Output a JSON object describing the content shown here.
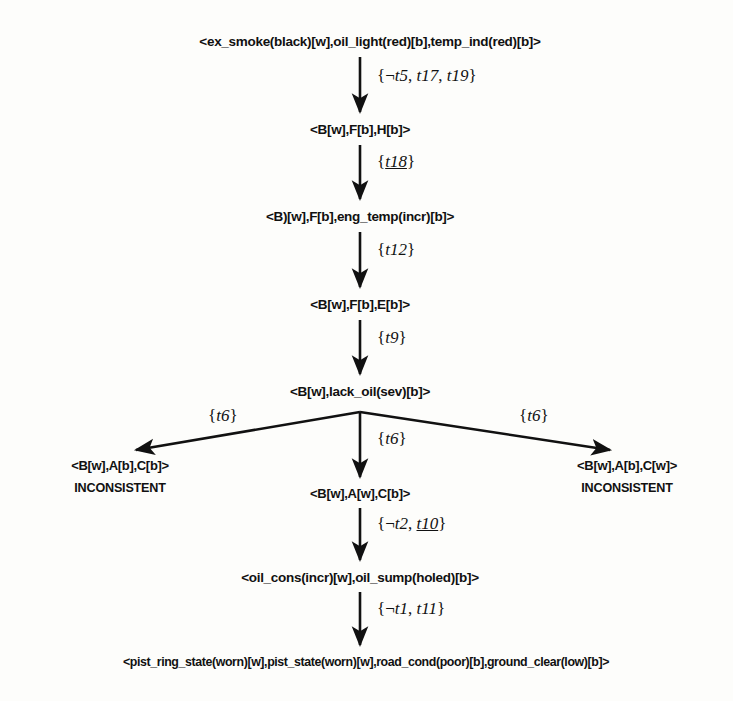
{
  "diagram": {
    "type": "state-transition-tree",
    "nodes": [
      {
        "id": "n1",
        "label": "<ex_smoke(black)[w],oil_light(red)[b],temp_ind(red)[b]>",
        "x": 370,
        "y": 42
      },
      {
        "id": "n2",
        "label": "<B[w],F[b],H[b]>",
        "x": 360,
        "y": 130
      },
      {
        "id": "n3",
        "label": "<B)[w],F[b],eng_temp(incr)[b]>",
        "x": 360,
        "y": 217
      },
      {
        "id": "n4",
        "label": "<B[w],F[b],E[b]>",
        "x": 360,
        "y": 305
      },
      {
        "id": "n5",
        "label": "<B[w],lack_oil(sev)[b]>",
        "x": 360,
        "y": 392
      },
      {
        "id": "n6",
        "label": "<B[w],A[b],C[b]>",
        "x": 120,
        "y": 466
      },
      {
        "id": "n7",
        "label": "<B[w],A[w],C[b]>",
        "x": 360,
        "y": 494
      },
      {
        "id": "n8",
        "label": "<B[w],A[b],C[w]>",
        "x": 627,
        "y": 466
      },
      {
        "id": "n9",
        "label": "<oil_cons(incr)[w],oil_sump(holed)[b]>",
        "x": 360,
        "y": 578
      },
      {
        "id": "n10",
        "label": "<pist_ring_state(worn)[w],pist_state(worn)[w],road_cond(poor)[b],ground_clear(low)[b]>",
        "x": 366,
        "y": 663
      }
    ],
    "status_labels": [
      {
        "id": "s1",
        "text": "INCONSISTENT",
        "x": 120,
        "y": 489
      },
      {
        "id": "s2",
        "text": "INCONSISTENT",
        "x": 627,
        "y": 489
      }
    ],
    "edges": [
      {
        "id": "e1",
        "from": "n1",
        "to": "n2",
        "label_parts": [
          {
            "text": "{",
            "style": "plain"
          },
          {
            "text": "¬",
            "style": "plain"
          },
          {
            "text": "t5",
            "style": "italic"
          },
          {
            "text": ", ",
            "style": "plain"
          },
          {
            "text": "t17",
            "style": "italic"
          },
          {
            "text": ", ",
            "style": "plain"
          },
          {
            "text": "t19",
            "style": "italic"
          },
          {
            "text": "}",
            "style": "plain"
          }
        ],
        "label_x": 377,
        "label_y": 76
      },
      {
        "id": "e2",
        "from": "n2",
        "to": "n3",
        "label_parts": [
          {
            "text": "{",
            "style": "plain"
          },
          {
            "text": "t18",
            "style": "italic-underline"
          },
          {
            "text": "}",
            "style": "plain"
          }
        ],
        "label_x": 377,
        "label_y": 162
      },
      {
        "id": "e3",
        "from": "n3",
        "to": "n4",
        "label_parts": [
          {
            "text": "{",
            "style": "plain"
          },
          {
            "text": "t12",
            "style": "italic"
          },
          {
            "text": "}",
            "style": "plain"
          }
        ],
        "label_x": 377,
        "label_y": 250
      },
      {
        "id": "e4",
        "from": "n4",
        "to": "n5",
        "label_parts": [
          {
            "text": "{",
            "style": "plain"
          },
          {
            "text": "t9",
            "style": "italic"
          },
          {
            "text": "}",
            "style": "plain"
          }
        ],
        "label_x": 377,
        "label_y": 338
      },
      {
        "id": "e5",
        "from": "n5",
        "to": "n6",
        "label_parts": [
          {
            "text": "{",
            "style": "plain"
          },
          {
            "text": "t6",
            "style": "italic"
          },
          {
            "text": "}",
            "style": "plain"
          }
        ],
        "label_x": 208,
        "label_y": 416
      },
      {
        "id": "e6",
        "from": "n5",
        "to": "n7",
        "label_parts": [
          {
            "text": "{",
            "style": "plain"
          },
          {
            "text": "t6",
            "style": "italic"
          },
          {
            "text": "}",
            "style": "plain"
          }
        ],
        "label_x": 377,
        "label_y": 439
      },
      {
        "id": "e7",
        "from": "n5",
        "to": "n8",
        "label_parts": [
          {
            "text": "{",
            "style": "plain"
          },
          {
            "text": "t6",
            "style": "italic"
          },
          {
            "text": "}",
            "style": "plain"
          }
        ],
        "label_x": 519,
        "label_y": 416
      },
      {
        "id": "e8",
        "from": "n7",
        "to": "n9",
        "label_parts": [
          {
            "text": "{",
            "style": "plain"
          },
          {
            "text": "¬",
            "style": "plain"
          },
          {
            "text": "t2",
            "style": "italic"
          },
          {
            "text": ", ",
            "style": "plain"
          },
          {
            "text": "t10",
            "style": "italic-underline"
          },
          {
            "text": "}",
            "style": "plain"
          }
        ],
        "label_x": 377,
        "label_y": 524
      },
      {
        "id": "e9",
        "from": "n9",
        "to": "n10",
        "label_parts": [
          {
            "text": "{",
            "style": "plain"
          },
          {
            "text": "¬",
            "style": "plain"
          },
          {
            "text": "t1",
            "style": "italic"
          },
          {
            "text": ", ",
            "style": "plain"
          },
          {
            "text": "t11",
            "style": "italic"
          },
          {
            "text": "}",
            "style": "plain"
          }
        ],
        "label_x": 377,
        "label_y": 609
      }
    ],
    "colors": {
      "ink": "#111111",
      "background": "#fdfdfb"
    }
  }
}
